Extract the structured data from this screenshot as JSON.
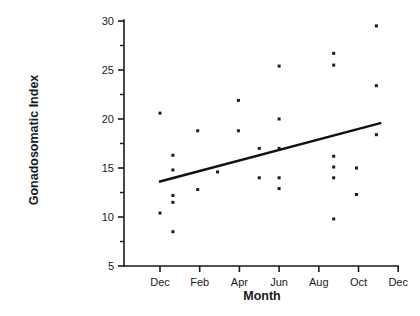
{
  "chart_data": {
    "type": "scatter",
    "title": "",
    "xlabel": "Month",
    "ylabel": "Gonadosomatic Index",
    "xlim": [
      0,
      13.5
    ],
    "ylim": [
      5,
      30
    ],
    "grid": false,
    "legend": null,
    "y_ticks_major": [
      5,
      10,
      15,
      20,
      25,
      30
    ],
    "y_tick_labels": [
      "5",
      "10",
      "15",
      "20",
      "25",
      "30"
    ],
    "y_ticks_minor": [
      7.5,
      12.5,
      17.5,
      22.5,
      27.5
    ],
    "x_ticks": [
      1,
      3,
      5,
      7,
      9,
      11,
      13
    ],
    "x_tick_labels": [
      "Dec",
      "Feb",
      "Apr",
      "Jun",
      "Aug",
      "Oct",
      "Dec"
    ],
    "points": [
      {
        "x": 1.0,
        "y": 20.6
      },
      {
        "x": 1.0,
        "y": 10.4
      },
      {
        "x": 1.65,
        "y": 16.3
      },
      {
        "x": 1.65,
        "y": 14.8
      },
      {
        "x": 1.65,
        "y": 12.2
      },
      {
        "x": 1.65,
        "y": 11.5
      },
      {
        "x": 1.65,
        "y": 8.5
      },
      {
        "x": 2.9,
        "y": 18.8
      },
      {
        "x": 2.9,
        "y": 12.8
      },
      {
        "x": 3.9,
        "y": 14.6
      },
      {
        "x": 4.95,
        "y": 21.9
      },
      {
        "x": 4.95,
        "y": 18.8
      },
      {
        "x": 6.0,
        "y": 17.0
      },
      {
        "x": 6.0,
        "y": 14.0
      },
      {
        "x": 7.0,
        "y": 25.4
      },
      {
        "x": 7.0,
        "y": 20.0
      },
      {
        "x": 7.0,
        "y": 17.0
      },
      {
        "x": 7.0,
        "y": 14.0
      },
      {
        "x": 7.0,
        "y": 12.9
      },
      {
        "x": 9.75,
        "y": 26.7
      },
      {
        "x": 9.75,
        "y": 25.5
      },
      {
        "x": 9.75,
        "y": 16.2
      },
      {
        "x": 9.75,
        "y": 15.1
      },
      {
        "x": 9.75,
        "y": 14.0
      },
      {
        "x": 9.75,
        "y": 9.8
      },
      {
        "x": 10.9,
        "y": 15.0
      },
      {
        "x": 10.9,
        "y": 12.3
      },
      {
        "x": 11.9,
        "y": 29.5
      },
      {
        "x": 11.9,
        "y": 23.4
      },
      {
        "x": 11.9,
        "y": 18.4
      }
    ],
    "trend_line": {
      "x_start": 0.95,
      "y_start": 13.6,
      "x_end": 12.15,
      "y_end": 19.6
    },
    "marker": {
      "shape": "square",
      "size_px": 3.0,
      "color": "#1a1a1a"
    },
    "colors": {
      "axis": "#1a1a1a",
      "point": "#1a1a1a",
      "trend": "#111111",
      "background": "#ffffff"
    }
  }
}
